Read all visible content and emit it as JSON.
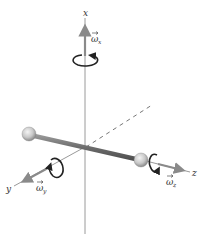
{
  "diagram": {
    "axes": {
      "x": {
        "label": "x",
        "omega_symbol": "ω",
        "omega_sub": "x"
      },
      "y": {
        "label": "y",
        "omega_symbol": "ω",
        "omega_sub": "y"
      },
      "z": {
        "label": "z",
        "omega_symbol": "ω",
        "omega_sub": "z"
      }
    },
    "colors": {
      "axis": "#9a9a9a",
      "rod": "#707070",
      "sphere": "#d0d0d0",
      "rotation_arrow": "#222222",
      "dashed": "#777777"
    }
  }
}
